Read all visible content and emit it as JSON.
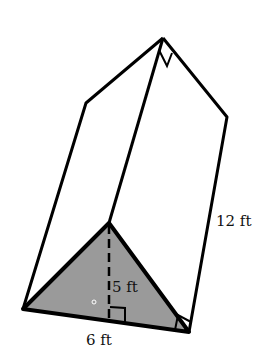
{
  "diagram": {
    "type": "triangular-prism",
    "labels": {
      "height": "5 ft",
      "base": "6 ft",
      "length": "12 ft"
    },
    "colors": {
      "stroke": "#000000",
      "face_fill": "#9a9a9a",
      "background": "#ffffff"
    }
  }
}
